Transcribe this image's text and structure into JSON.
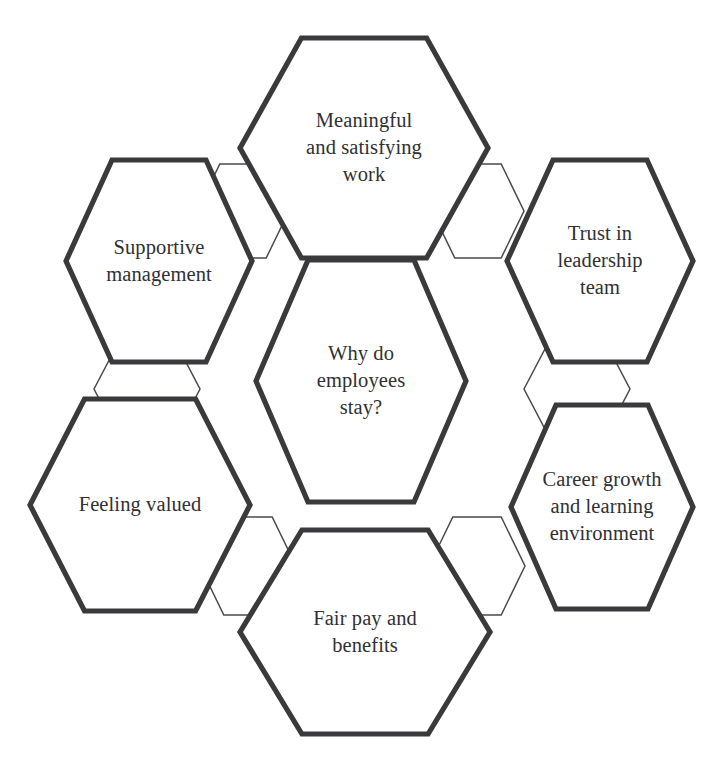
{
  "diagram": {
    "type": "hexagon-cluster",
    "title_node": "Why do employees stay?",
    "background_color": "#ffffff",
    "outline_color": "#3a3a3c",
    "connector_color": "#4a4a4c",
    "text_color": "#2f3033",
    "nodes": [
      {
        "id": "center",
        "label": "Why do\nemployees\nstay?",
        "role": "central-question",
        "cx": 361,
        "cy": 381,
        "half_width": 105,
        "half_height": 121
      },
      {
        "id": "top",
        "label": "Meaningful\nand satisfying\nwork",
        "role": "factor",
        "cx": 364,
        "cy": 148,
        "half_width": 124,
        "half_height": 110
      },
      {
        "id": "upper-left",
        "label": "Supportive\nmanagement",
        "role": "factor",
        "cx": 159,
        "cy": 261,
        "half_width": 93,
        "half_height": 101
      },
      {
        "id": "upper-right",
        "label": "Trust in\nleadership\nteam",
        "role": "factor",
        "cx": 600,
        "cy": 261,
        "half_width": 93,
        "half_height": 101
      },
      {
        "id": "lower-left",
        "label": "Feeling valued",
        "role": "factor",
        "cx": 140,
        "cy": 505,
        "half_width": 110,
        "half_height": 106
      },
      {
        "id": "lower-right",
        "label": "Career growth\nand learning\nenvironment",
        "role": "factor",
        "cx": 602,
        "cy": 507,
        "half_width": 91,
        "half_height": 102
      },
      {
        "id": "bottom",
        "label": "Fair pay and\nbenefits",
        "role": "factor",
        "cx": 365,
        "cy": 632,
        "half_width": 125,
        "half_height": 102
      }
    ],
    "connectors": [
      {
        "id": "connector-top-right",
        "cx": 478,
        "cy": 211,
        "half_width": 46,
        "half_height": 47
      },
      {
        "id": "connector-left-mid",
        "cx": 147,
        "cy": 389,
        "half_width": 53,
        "half_height": 50
      },
      {
        "id": "connector-right-mid",
        "cx": 577,
        "cy": 389,
        "half_width": 53,
        "half_height": 50
      },
      {
        "id": "connector-bottom-left",
        "cx": 248,
        "cy": 566,
        "half_width": 48,
        "half_height": 49
      },
      {
        "id": "connector-bottom-right",
        "cx": 477,
        "cy": 566,
        "half_width": 48,
        "half_height": 49
      },
      {
        "id": "connector-top-left",
        "cx": 243,
        "cy": 211,
        "half_width": 46,
        "half_height": 47
      }
    ]
  }
}
